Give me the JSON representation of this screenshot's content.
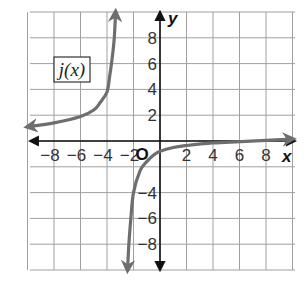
{
  "chart_data": {
    "type": "line",
    "title": "",
    "function_label": "j(x)",
    "xlabel": "x",
    "ylabel": "y",
    "origin_label": "O",
    "xlim": [
      -10,
      10
    ],
    "ylim": [
      -10,
      10
    ],
    "grid": true,
    "grid_step": 2,
    "x_ticks": [
      -8,
      -6,
      -4,
      -2,
      2,
      4,
      6,
      8
    ],
    "x_tick_labels": [
      "−8",
      "−6",
      "−4",
      "−2",
      "2",
      "4",
      "6",
      "8"
    ],
    "y_ticks": [
      8,
      6,
      4,
      2,
      -4,
      -6,
      -8
    ],
    "y_tick_labels": [
      "8",
      "6",
      "4",
      "2",
      "−4",
      "−6",
      "−8"
    ],
    "vertical_asymptote": -3,
    "horizontal_asymptote_right": 0,
    "series": [
      {
        "name": "j(x) left branch",
        "x": [
          -10,
          -8,
          -6,
          -5,
          -4.5,
          -4,
          -3.8,
          -3.6,
          -3.45,
          -3.35
        ],
        "y": [
          1.1,
          1.4,
          1.9,
          2.4,
          3.0,
          3.8,
          5.0,
          6.5,
          8.0,
          10.0
        ],
        "arrows": "both"
      },
      {
        "name": "j(x) right branch",
        "x": [
          -2.45,
          -2.35,
          -2.2,
          -2.0,
          -1.5,
          -1.0,
          -0.5,
          0,
          1,
          2,
          4,
          6,
          8,
          10
        ],
        "y": [
          -10.0,
          -8.0,
          -6.0,
          -4.0,
          -2.3,
          -1.6,
          -1.1,
          -0.8,
          -0.5,
          -0.35,
          -0.15,
          -0.05,
          0.05,
          0.15
        ],
        "arrows": "both"
      }
    ],
    "colors": {
      "curve": "#6e6e6e",
      "axis": "#111111",
      "grid": "#a0a0a0",
      "text": "#333333"
    }
  }
}
